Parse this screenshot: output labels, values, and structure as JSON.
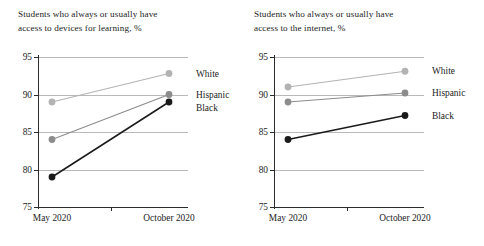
{
  "figure": {
    "y_ticks": [
      95,
      90,
      85,
      80,
      75
    ],
    "x_categories": [
      "May 2020",
      "October 2020"
    ],
    "series_names": [
      "White",
      "Hispanic",
      "Black"
    ],
    "colors": {
      "white_series": "#b3b3b3",
      "hispanic_series": "#8c8c8c",
      "black_series": "#1a1a1a",
      "gridline": "#b9b9b9",
      "axis": "#2b2b2b",
      "text": "#1c1c1c"
    }
  },
  "chart_data": [
    {
      "type": "line",
      "title": "Students who always or usually have access to devices for learning, %",
      "title_line1": "Students who always or usually have",
      "title_line2": "access to devices for learning, %",
      "xlabel": "",
      "ylabel": "",
      "categories": [
        "May 2020",
        "October 2020"
      ],
      "ylim": [
        75,
        95
      ],
      "yticks": [
        75,
        80,
        85,
        90,
        95
      ],
      "grid": true,
      "legend_position": "right-inline",
      "series": [
        {
          "name": "White",
          "values": [
            89,
            92.8
          ],
          "color": "#b3b3b3"
        },
        {
          "name": "Hispanic",
          "values": [
            84,
            90.0
          ],
          "color": "#8c8c8c"
        },
        {
          "name": "Black",
          "values": [
            79,
            89.0
          ],
          "color": "#1a1a1a"
        }
      ]
    },
    {
      "type": "line",
      "title": "Students who always or usually have access to the internet, %",
      "title_line1": "Students who always or usually have",
      "title_line2": "access to the internet, %",
      "xlabel": "",
      "ylabel": "",
      "categories": [
        "May 2020",
        "October 2020"
      ],
      "ylim": [
        75,
        95
      ],
      "yticks": [
        75,
        80,
        85,
        90,
        95
      ],
      "grid": true,
      "legend_position": "right-inline",
      "series": [
        {
          "name": "White",
          "values": [
            91.0,
            93.1
          ],
          "color": "#b3b3b3"
        },
        {
          "name": "Hispanic",
          "values": [
            89.0,
            90.2
          ],
          "color": "#8c8c8c"
        },
        {
          "name": "Black",
          "values": [
            84.0,
            87.2
          ],
          "color": "#1a1a1a"
        }
      ]
    }
  ]
}
